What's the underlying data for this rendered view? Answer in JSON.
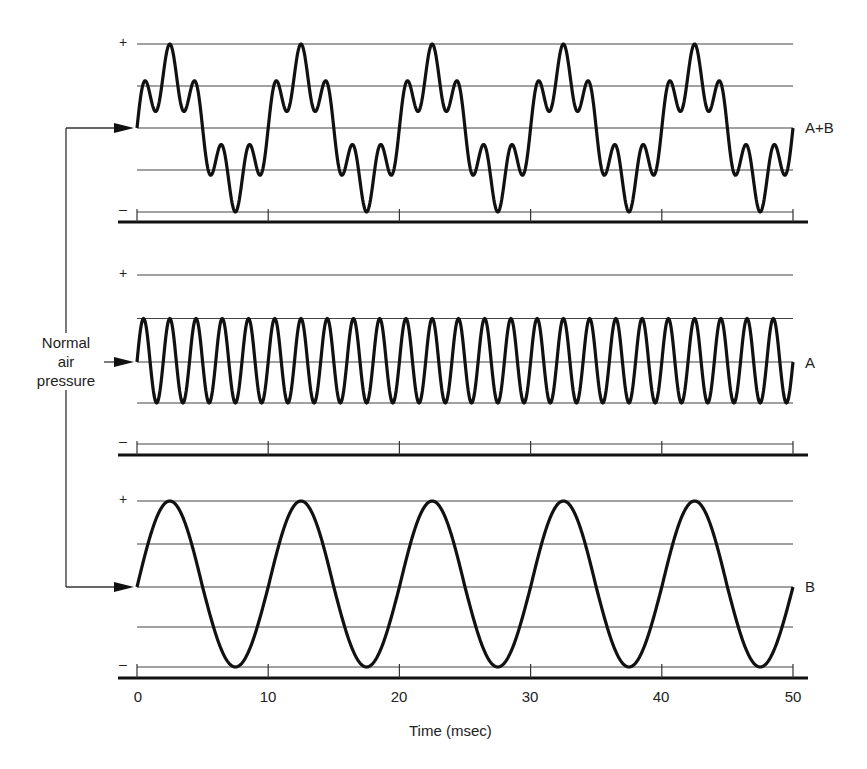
{
  "figure": {
    "note": "Normal air pressure",
    "note_lines": [
      "Normal",
      "air",
      "pressure"
    ],
    "xlabel": "Time (msec)",
    "ticks": [
      "0",
      "10",
      "20",
      "30",
      "40",
      "50"
    ],
    "plus": "+",
    "minus": "–",
    "panels": [
      {
        "id": "ab",
        "label": "A+B"
      },
      {
        "id": "a",
        "label": "A"
      },
      {
        "id": "b",
        "label": "B"
      }
    ]
  },
  "chart_data": {
    "type": "line",
    "title": "",
    "xlabel": "Time (msec)",
    "ylabel": "Air pressure (relative to normal)",
    "xlim": [
      0,
      50
    ],
    "x_ticks": [
      0,
      10,
      20,
      30,
      40,
      50
    ],
    "y_levels": [
      "+",
      "0 (normal air pressure)",
      "–"
    ],
    "grid": true,
    "series": [
      {
        "name": "A+B",
        "description": "Sum of A and B: compound wave with double-humped peaks and troughs",
        "period_ms": 10,
        "components": [
          "A",
          "B"
        ]
      },
      {
        "name": "A",
        "description": "Sine wave, half amplitude",
        "amplitude": 0.5,
        "period_ms": 2,
        "frequency_hz": 500,
        "cycles_shown": 25
      },
      {
        "name": "B",
        "description": "Sine wave, full amplitude",
        "amplitude": 1.0,
        "period_ms": 10,
        "frequency_hz": 100,
        "cycles_shown": 5
      }
    ]
  }
}
